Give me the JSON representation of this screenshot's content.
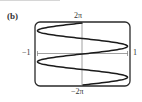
{
  "panel": {
    "label": "(b)"
  },
  "axes": {
    "y_max_label": "2π",
    "y_min_label": "−2π",
    "x_min_label": "−1",
    "x_max_label": "1"
  },
  "chart_data": {
    "type": "line",
    "title": "",
    "panel_label": "(b)",
    "equation": "x = sin(y)",
    "xlabel": "",
    "ylabel": "",
    "xlim": [
      -1,
      1
    ],
    "ylim": [
      -6.2832,
      6.2832
    ],
    "x_tick_labels": [
      "−1",
      "1"
    ],
    "y_tick_labels": [
      "−2π",
      "2π"
    ],
    "grid": false,
    "legend": null,
    "series": [
      {
        "name": "x = sin(y)",
        "points": [
          {
            "y": 6.2832,
            "x": 0
          },
          {
            "y": 4.7124,
            "x": -1
          },
          {
            "y": 3.1416,
            "x": 0
          },
          {
            "y": 1.5708,
            "x": 1
          },
          {
            "y": 0,
            "x": 0
          },
          {
            "y": -1.5708,
            "x": -1
          },
          {
            "y": -3.1416,
            "x": 0
          },
          {
            "y": -4.7124,
            "x": 1
          },
          {
            "y": -6.2832,
            "x": 0
          }
        ]
      }
    ],
    "colors": {
      "curve": "#1a1a1a",
      "axes": "#888888",
      "frame": "#2a2a2a"
    }
  }
}
